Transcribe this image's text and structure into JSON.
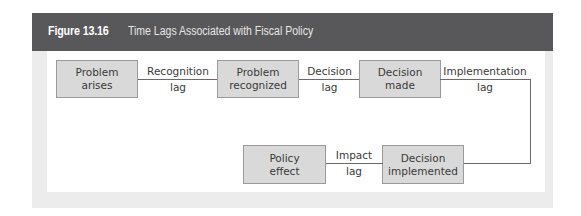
{
  "figure": {
    "number": "Figure 13.16",
    "title": "Time Lags Associated with Fiscal Policy"
  },
  "diagram": {
    "nodes": [
      {
        "id": "problem-arises",
        "line1": "Problem",
        "line2": "arises"
      },
      {
        "id": "problem-recognized",
        "line1": "Problem",
        "line2": "recognized"
      },
      {
        "id": "decision-made",
        "line1": "Decision",
        "line2": "made"
      },
      {
        "id": "decision-implemented",
        "line1": "Decision",
        "line2": "implemented"
      },
      {
        "id": "policy-effect",
        "line1": "Policy",
        "line2": "effect"
      }
    ],
    "edges": [
      {
        "from": "problem-arises",
        "to": "problem-recognized",
        "label_top": "Recognition",
        "label_bottom": "lag"
      },
      {
        "from": "problem-recognized",
        "to": "decision-made",
        "label_top": "Decision",
        "label_bottom": "lag"
      },
      {
        "from": "decision-made",
        "to": "decision-implemented",
        "label_top": "Implementation",
        "label_bottom": "lag"
      },
      {
        "from": "decision-implemented",
        "to": "policy-effect",
        "label_top": "Impact",
        "label_bottom": "lag"
      }
    ]
  },
  "colors": {
    "header_bg": "#58585a",
    "box_fill": "#d9d9d9",
    "box_border": "#9a9a9a",
    "line": "#6a6a6a",
    "panel_bg": "#ececec"
  }
}
